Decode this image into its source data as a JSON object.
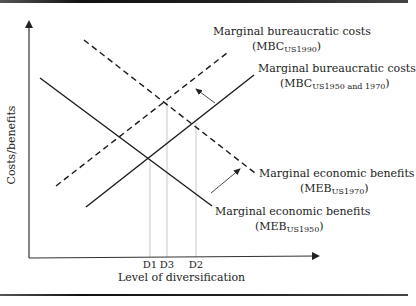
{
  "diagram": {
    "axes": {
      "y_label": "Costs/benefits",
      "x_label": "Level of diversification",
      "ticks": [
        {
          "label": "D1",
          "x": 150
        },
        {
          "label": "D3",
          "x": 167
        },
        {
          "label": "D2",
          "x": 196
        }
      ]
    },
    "curves": {
      "mbc_1990": {
        "title": "Marginal bureaucratic costs",
        "abbr": "MBC",
        "sub": "US1990",
        "style": "dashed",
        "x1": 56,
        "y1": 186,
        "x2": 227,
        "y2": 53
      },
      "mbc_1950_1970": {
        "title": "Marginal bureaucratic costs",
        "abbr": "MBC",
        "sub": "US1950 and 1970",
        "style": "solid",
        "x1": 86,
        "y1": 207,
        "x2": 254,
        "y2": 75
      },
      "meb_1970": {
        "title": "Marginal economic benefits",
        "abbr": "MEB",
        "sub": "US1970",
        "style": "dashed",
        "x1": 84,
        "y1": 40,
        "x2": 255,
        "y2": 173
      },
      "meb_1950": {
        "title": "Marginal economic benefits",
        "abbr": "MEB",
        "sub": "US1950",
        "style": "solid",
        "x1": 40,
        "y1": 78,
        "x2": 212,
        "y2": 206
      }
    },
    "arrows": [
      {
        "meaning": "MBC shift up-left (1970 to 1990)",
        "x1": 215,
        "y1": 103,
        "x2": 196,
        "y2": 89
      },
      {
        "meaning": "MEB shift up-right (1950 to 1970)",
        "x1": 211,
        "y1": 193,
        "x2": 240,
        "y2": 169
      }
    ],
    "guides": [
      {
        "label": "D1",
        "x": 150,
        "y_top": 160
      },
      {
        "label": "D3",
        "x": 167,
        "y_top": 101
      },
      {
        "label": "D2",
        "x": 196,
        "y_top": 123
      }
    ]
  }
}
